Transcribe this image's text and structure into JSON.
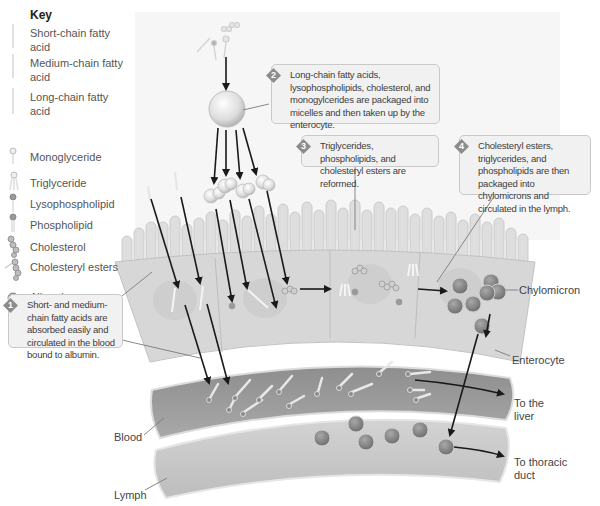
{
  "key": {
    "title": "Key",
    "items": [
      {
        "label": "Short-chain fatty acid",
        "icon": "short-chain-fatty-acid-icon"
      },
      {
        "label": "Medium-chain fatty acid",
        "icon": "medium-chain-fatty-acid-icon"
      },
      {
        "label": "Long-chain fatty acid",
        "icon": "long-chain-fatty-acid-icon"
      },
      {
        "label": "Monoglyceride",
        "icon": "monoglyceride-icon"
      },
      {
        "label": "Triglyceride",
        "icon": "triglyceride-icon"
      },
      {
        "label": "Lysophospholipid",
        "icon": "lysophospholipid-icon"
      },
      {
        "label": "Phospholipid",
        "icon": "phospholipid-icon"
      },
      {
        "label": "Cholesterol",
        "icon": "cholesterol-icon"
      },
      {
        "label": "Cholesteryl esters",
        "icon": "cholesteryl-esters-icon"
      },
      {
        "label": "Albumin",
        "icon": "albumin-icon"
      }
    ]
  },
  "callouts": [
    {
      "step": "1",
      "text": "Short- and medium-chain fatty acids are absorbed easily and circulated in the blood bound to albumin."
    },
    {
      "step": "2",
      "text": "Long-chain fatty acids, lysophospholipids, cholesterol, and monogylcerides are packaged into micelles and then taken up by the enterocyte."
    },
    {
      "step": "3",
      "text": "Triglycerides, phospholipids, and cholesteryl esters are reformed."
    },
    {
      "step": "4",
      "text": "Cholesteryl esters, triglycerides, and phospholipids are then packaged into chylomicrons and circulated in the lymph."
    }
  ],
  "labels": {
    "chylomicron": "Chylomicron",
    "enterocyte": "Enterocyte",
    "to_liver": "To the liver",
    "blood": "Blood",
    "to_thoracic_duct": "To thoracic duct",
    "lymph": "Lymph"
  },
  "colors": {
    "background_panel": "#f4f4f4",
    "cell": "#d9d9d9",
    "blood_vessel": "#9a9a9a",
    "lymph_vessel": "#c8c8c8",
    "chylomicron": "#8a8a8a",
    "arrow": "#1a1a1a",
    "callout_bg": "#f1f1f1",
    "step_badge": "#8c8c8c"
  }
}
